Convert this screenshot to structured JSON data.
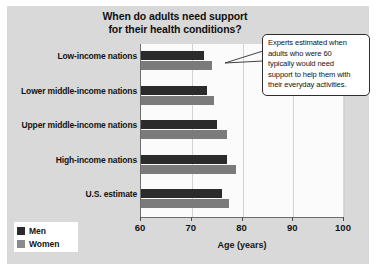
{
  "chart_data": {
    "type": "bar",
    "orientation": "horizontal",
    "title": "When do adults need support for their health conditions?",
    "title_lines": [
      "When do adults need support",
      "for their health conditions?"
    ],
    "xlabel": "Age (years)",
    "ylabel": "",
    "xlim": [
      60,
      100
    ],
    "xticks": [
      60,
      70,
      80,
      90,
      100
    ],
    "xtick_labels": [
      "60",
      "70",
      "80",
      "90",
      "100"
    ],
    "grid": true,
    "legend_position": "bottom-left",
    "categories": [
      "Low-income nations",
      "Lower middle-income nations",
      "Upper middle-income nations",
      "High-income nations",
      "U.S. estimate"
    ],
    "series": [
      {
        "name": "Men",
        "color": "#2b2b2b",
        "values": [
          72.5,
          73.0,
          75.0,
          77.0,
          76.0
        ]
      },
      {
        "name": "Women",
        "color": "#7b7b7b",
        "values": [
          74.0,
          74.3,
          76.9,
          78.7,
          77.3
        ]
      }
    ],
    "annotations": [
      {
        "name": "callout",
        "text": "Experts estimated when adults who were 60 typically would need support to help them with their everyday activities.",
        "lines": [
          "Experts estimated when",
          "adults who were 60",
          "typically would need",
          "support to help them with",
          "their everyday activities."
        ]
      }
    ]
  },
  "colors": {
    "panel_background": "#d9d9d9",
    "plot_background": "#fbfbfb",
    "men": "#2b2b2b",
    "women": "#7b7b7b",
    "axis": "#6d6d6d",
    "gridline": "#d2d2d2",
    "text": "#141414"
  }
}
